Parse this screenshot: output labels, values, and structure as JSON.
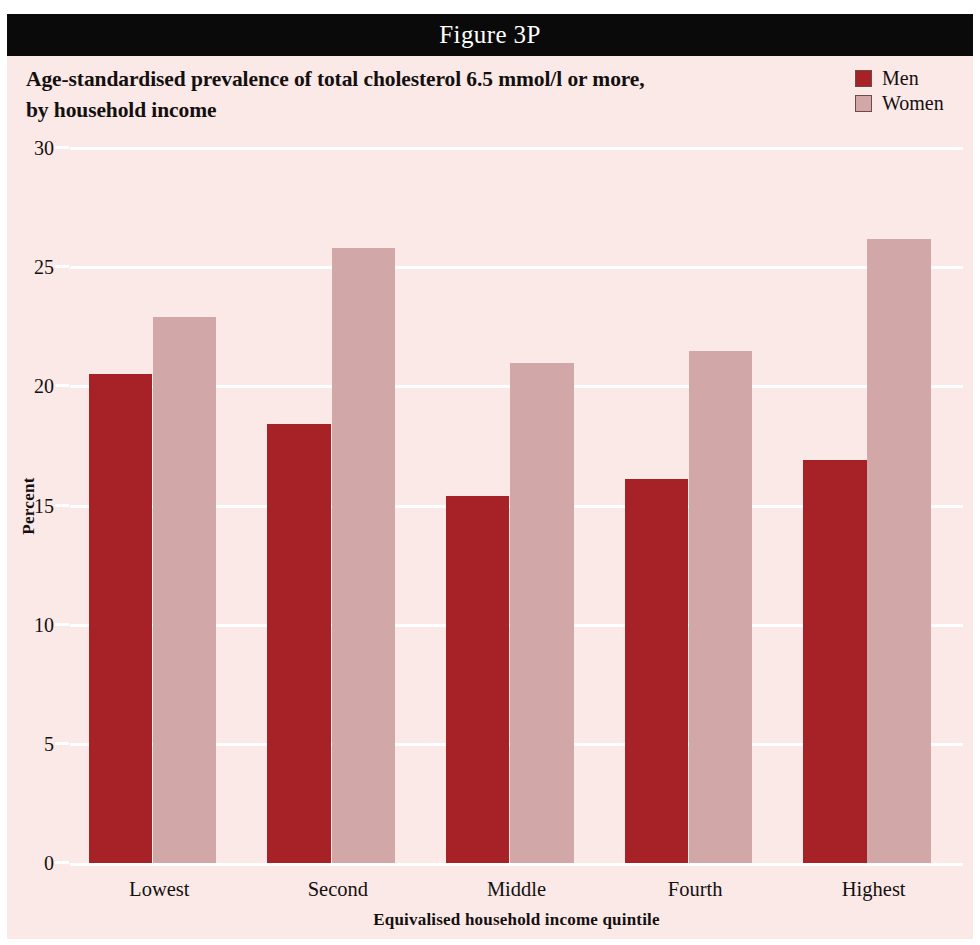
{
  "figure": {
    "caption": "Figure 3P",
    "title_lines": [
      "Age-standardised prevalence of total cholesterol 6.5 mmol/l or more,",
      "by household income"
    ],
    "background_color": "#fbe9e7",
    "caption_bar_color": "#0b0a0a"
  },
  "legend": {
    "position": "top-right",
    "items": [
      {
        "label": "Men",
        "color": "#a62226"
      },
      {
        "label": "Women",
        "color": "#d2a7a8"
      }
    ]
  },
  "chart_data": {
    "type": "bar",
    "title": "Age-standardised prevalence of total cholesterol 6.5 mmol/l or more, by household income",
    "categories": [
      "Lowest",
      "Second",
      "Middle",
      "Fourth",
      "Highest"
    ],
    "series": [
      {
        "name": "Men",
        "color": "#a62226",
        "values": [
          20.5,
          18.4,
          15.4,
          16.1,
          16.9
        ]
      },
      {
        "name": "Women",
        "color": "#d2a7a8",
        "values": [
          22.9,
          25.8,
          21.0,
          21.5,
          26.2
        ]
      }
    ],
    "xlabel": "Equivalised household income quintile",
    "ylabel": "Percent",
    "ylim": [
      0,
      30
    ],
    "yticks": [
      0,
      5,
      10,
      15,
      20,
      25,
      30
    ],
    "ytick_labels": [
      "0",
      "5",
      "10",
      "15",
      "20",
      "25",
      "30"
    ],
    "grid": true,
    "gridline_color": "#ffffff",
    "legend_position": "top-right"
  }
}
